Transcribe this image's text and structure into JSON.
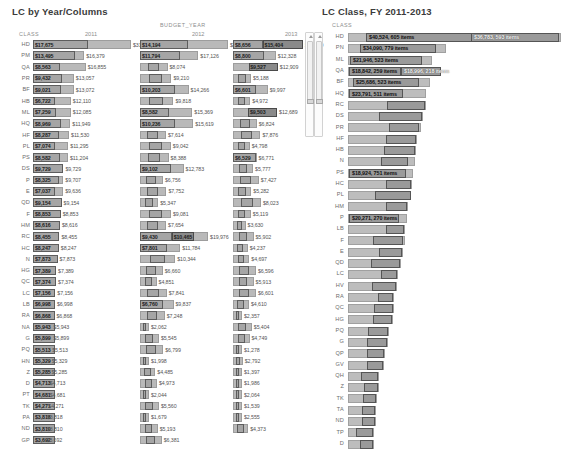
{
  "left": {
    "title": "LC by Year/Columns",
    "class_header": "CLASS",
    "group_header": "BUDGET_YEAR",
    "years": [
      "2011",
      "2012",
      "2013"
    ],
    "scrollbar": "vertical-scrollbar"
  },
  "right": {
    "title": "LC Class,  FY 2011-2013",
    "class_header": "CLASS",
    "scrollbar": "vertical-scrollbar"
  },
  "chart_data": [
    {
      "type": "bar",
      "title": "LC by Year/Columns",
      "xlabel": "",
      "ylabel": "CLASS",
      "group_label": "BUDGET_YEAR",
      "categories": [
        "HD",
        "PM",
        "QA",
        "PR",
        "BF",
        "HB",
        "ML",
        "HQ",
        "HF",
        "PL",
        "PS",
        "DS",
        "P",
        "E",
        "QD",
        "F",
        "HM",
        "RC",
        "HC",
        "N",
        "HG",
        "QC",
        "LC",
        "LB",
        "RA",
        "NA",
        "G",
        "PQ",
        "HN",
        "Z",
        "D",
        "PT",
        "TK",
        "PA",
        "ND",
        "GP"
      ],
      "series": [
        {
          "name": "2011",
          "values": [
            "$17,675",
            "$13,495",
            "$8,563",
            "$9,432",
            "$9,021",
            "$6,722",
            "$7,259",
            "$8,969",
            "$8,287",
            "$7,074",
            "$8,582",
            "$9,729",
            "$8,325",
            "$7,037",
            "$9,154",
            "$8,853",
            "$8,616",
            "$8,455",
            "$8,247",
            "$7,873",
            "$7,389",
            "$7,374",
            "$7,156",
            "$6,998",
            "$6,868",
            "$5,943",
            "$5,899",
            "$5,513",
            "$5,329",
            "$5,285",
            "$4,713",
            "$4,681",
            "$4,271",
            "$3,818",
            "$3,810",
            "$3,692"
          ],
          "totals": [
            "$31,345",
            "$16,379",
            "$16,855",
            "$13,057",
            "$13,072",
            "$12,110",
            "$12,085",
            "$11,949",
            "$11,530",
            "$11,295",
            "$11,204",
            "$9,729",
            "$9,707",
            "$9,636",
            "$9,154",
            "$8,853",
            "$8,616",
            "$8,455",
            "$8,247",
            "$7,873",
            "$7,389",
            "$7,374",
            "$7,156",
            "$6,998",
            "$6,868",
            "$5,943",
            "$5,899",
            "$5,513",
            "$5,329",
            "$5,285",
            "$4,713",
            "$4,681",
            "$4,271",
            "$3,818",
            "$3,810",
            "$3,692"
          ]
        },
        {
          "name": "2012",
          "values": [
            "$14,194",
            "$11,794",
            "",
            "",
            "$10,203",
            "",
            "$8,582",
            "$10,236",
            "",
            "",
            "",
            "$9,102",
            "",
            "",
            "",
            "",
            "",
            "$9,430",
            "$7,801",
            "",
            "",
            "",
            "",
            "$6,760",
            "",
            "",
            "",
            "",
            "",
            "",
            "",
            "",
            "",
            "",
            "",
            ""
          ],
          "totals": [
            "$25,823",
            "$17,126",
            "$8,074",
            "$9,210",
            "$14,266",
            "$9,818",
            "$15,369",
            "$15,619",
            "$7,614",
            "$9,042",
            "$8,388",
            "$12,783",
            "$6,756",
            "$7,752",
            "$5,347",
            "$9,081",
            "$7,654",
            "$19,976",
            "$11,784",
            "$10,344",
            "$6,660",
            "$4,851",
            "$7,841",
            "$9,837",
            "$7,248",
            "$2,062",
            "$5,545",
            "$6,799",
            "$1,998",
            "$4,485",
            "$4,973",
            "$2,044",
            "$5,560",
            "$1,679",
            "$5,193",
            "$6,381"
          ],
          "mids": [
            "",
            "",
            "",
            "",
            "",
            "",
            "",
            "",
            "",
            "",
            "",
            "",
            "",
            "",
            "",
            "",
            "",
            "$10,465",
            "",
            "",
            "",
            "",
            "",
            "",
            "",
            "",
            "",
            "",
            "",
            "",
            "",
            "",
            "",
            "",
            "",
            ""
          ]
        },
        {
          "name": "2013",
          "values": [
            "$8,656",
            "$8,800",
            "",
            "",
            "$6,601",
            "",
            "",
            "",
            "",
            "",
            "$6,529",
            "",
            "",
            "",
            "",
            "",
            "",
            "",
            "",
            "",
            "",
            "",
            "",
            "",
            "",
            "",
            "",
            "",
            "",
            "",
            "",
            "",
            "",
            "",
            "",
            ""
          ],
          "totals": [
            "$20,139",
            "$12,328",
            "$12,909",
            "$5,188",
            "$9,997",
            "$4,972",
            "$12,689",
            "$6,824",
            "$7,876",
            "$4,798",
            "$6,771",
            "$5,777",
            "$7,427",
            "$5,282",
            "$8,023",
            "$5,119",
            "$3,630",
            "$5,902",
            "$4,237",
            "$4,697",
            "$6,596",
            "$5,913",
            "$6,601",
            "$4,610",
            "$2,357",
            "$5,404",
            "$4,749",
            "$1,278",
            "$2,792",
            "$1,397",
            "$1,986",
            "$2,064",
            "$1,539",
            "$2,555",
            "$4,373",
            ""
          ],
          "mids": [
            "$15,404",
            "",
            "$9,527",
            "",
            "",
            "",
            "$9,503",
            "",
            "",
            "",
            "",
            "",
            "",
            "",
            "",
            "",
            "",
            "",
            "",
            "",
            "",
            "",
            "",
            "",
            "",
            "",
            "",
            "",
            "",
            "",
            "",
            "",
            "",
            "",
            "",
            ""
          ]
        }
      ]
    },
    {
      "type": "bar",
      "title": "LC Class,  FY 2011-2013",
      "ylabel": "CLASS",
      "categories": [
        "HD",
        "PN",
        "ML",
        "QA",
        "BF",
        "HQ",
        "RC",
        "DS",
        "PR",
        "HF",
        "HB",
        "N",
        "PS",
        "HC",
        "PL",
        "HM",
        "P",
        "LB",
        "F",
        "E",
        "QD",
        "LC",
        "HV",
        "RA",
        "QC",
        "HG",
        "PQ",
        "G",
        "QP",
        "GV",
        "QH",
        "Z",
        "TK",
        "TA",
        "ND",
        "TP",
        "D"
      ],
      "labels": [
        {
          "class": "HD",
          "segments": [
            "$40,524, 605 items",
            "$36,783, 593 items"
          ],
          "total_w": 213,
          "seg1": [
            18,
            118
          ],
          "seg2": [
            123,
            88
          ]
        },
        {
          "class": "PN",
          "segments": [
            "$34,090, 779 items"
          ],
          "total_w": 98,
          "seg1": [
            12,
            76
          ]
        },
        {
          "class": "ML",
          "segments": [
            "$21,946, 523 items"
          ],
          "total_w": 84,
          "seg1": [
            2,
            72
          ]
        },
        {
          "class": "QA",
          "segments": [
            "$18,842, 259 items",
            "$18,996, 218 items"
          ],
          "total_w": 82,
          "seg1": [
            1,
            52
          ],
          "seg2": [
            53,
            40
          ]
        },
        {
          "class": "BF",
          "segments": [
            "$25,686, 523 items"
          ],
          "total_w": 82,
          "seg1": [
            5,
            66
          ]
        },
        {
          "class": "HQ",
          "segments": [
            "$23,791, 511 items"
          ],
          "total_w": 78,
          "seg1": [
            1,
            54
          ]
        },
        {
          "class": "RC",
          "segments": [],
          "total_w": 78,
          "seg1": [
            39,
            38
          ]
        },
        {
          "class": "DS",
          "segments": [],
          "total_w": 75,
          "seg1": [
            31,
            43
          ]
        },
        {
          "class": "PR",
          "segments": [],
          "total_w": 73,
          "seg1": [
            41,
            30
          ]
        },
        {
          "class": "HF",
          "segments": [],
          "total_w": 69,
          "seg1": [
            38,
            30
          ]
        },
        {
          "class": "HB",
          "segments": [],
          "total_w": 68,
          "seg1": [
            36,
            31
          ]
        },
        {
          "class": "N",
          "segments": [],
          "total_w": 67,
          "seg1": [
            33,
            27
          ]
        },
        {
          "class": "PS",
          "segments": [
            "$18,924, 751 items"
          ],
          "total_w": 65,
          "seg1": [
            1,
            57
          ]
        },
        {
          "class": "HC",
          "segments": [],
          "total_w": 64,
          "seg1": [
            38,
            25
          ]
        },
        {
          "class": "PL",
          "segments": [],
          "total_w": 63,
          "seg1": [
            27,
            36
          ]
        },
        {
          "class": "HM",
          "segments": [],
          "total_w": 60,
          "seg1": [
            38,
            21
          ]
        },
        {
          "class": "P",
          "segments": [
            "$20,271, 270 items"
          ],
          "total_w": 59,
          "seg1": [
            1,
            50
          ]
        },
        {
          "class": "LB",
          "segments": [],
          "total_w": 57,
          "seg1": [
            38,
            18
          ]
        },
        {
          "class": "F",
          "segments": [],
          "total_w": 57,
          "seg1": [
            25,
            30
          ]
        },
        {
          "class": "E",
          "segments": [],
          "total_w": 55,
          "seg1": [
            31,
            23
          ]
        },
        {
          "class": "QD",
          "segments": [],
          "total_w": 53,
          "seg1": [
            23,
            29
          ]
        },
        {
          "class": "LC",
          "segments": [],
          "total_w": 50,
          "seg1": [
            33,
            16
          ]
        },
        {
          "class": "HV",
          "segments": [],
          "total_w": 49,
          "seg1": [
            24,
            24
          ]
        },
        {
          "class": "RA",
          "segments": [],
          "total_w": 46,
          "seg1": [
            30,
            15
          ]
        },
        {
          "class": "QC",
          "segments": [],
          "total_w": 46,
          "seg1": [
            26,
            19
          ]
        },
        {
          "class": "HG",
          "segments": [],
          "total_w": 45,
          "seg1": [
            25,
            19
          ]
        },
        {
          "class": "PQ",
          "segments": [],
          "total_w": 41,
          "seg1": [
            20,
            20
          ]
        },
        {
          "class": "G",
          "segments": [],
          "total_w": 40,
          "seg1": [
            19,
            20
          ]
        },
        {
          "class": "QP",
          "segments": [],
          "total_w": 37,
          "seg1": [
            19,
            17
          ]
        },
        {
          "class": "GV",
          "segments": [],
          "total_w": 36,
          "seg1": [
            19,
            16
          ]
        },
        {
          "class": "QH",
          "segments": [],
          "total_w": 31,
          "seg1": [
            13,
            17
          ]
        },
        {
          "class": "Z",
          "segments": [],
          "total_w": 31,
          "seg1": [
            16,
            14
          ]
        },
        {
          "class": "TK",
          "segments": [],
          "total_w": 29,
          "seg1": [
            15,
            13
          ]
        },
        {
          "class": "TA",
          "segments": [],
          "total_w": 28,
          "seg1": [
            14,
            13
          ]
        },
        {
          "class": "ND",
          "segments": [],
          "total_w": 28,
          "seg1": [
            14,
            13
          ]
        },
        {
          "class": "TP",
          "segments": [],
          "total_w": 26,
          "seg1": [
            8,
            17
          ]
        },
        {
          "class": "D",
          "segments": [],
          "total_w": 26,
          "seg1": [
            12,
            13
          ]
        }
      ]
    }
  ]
}
